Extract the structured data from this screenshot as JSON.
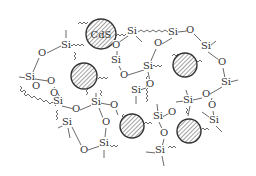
{
  "diagram": {
    "title": "",
    "colors": {
      "line": "#444444",
      "text": "#333333",
      "particle_fill": "#ffffff",
      "hatch": "#555555"
    },
    "nanoparticles": [
      {
        "id": "np1",
        "label": "CdS",
        "cx": 101,
        "cy": 34,
        "r": 15
      },
      {
        "id": "np2",
        "label": "",
        "cx": 84,
        "cy": 76,
        "r": 13
      },
      {
        "id": "np3",
        "label": "",
        "cx": 185,
        "cy": 65,
        "r": 12
      },
      {
        "id": "np4",
        "label": "",
        "cx": 132,
        "cy": 126,
        "r": 12
      },
      {
        "id": "np5",
        "label": "",
        "cx": 189,
        "cy": 131,
        "r": 12
      }
    ],
    "atoms": [
      {
        "t": "Si",
        "x": 66,
        "y": 47
      },
      {
        "t": "O",
        "x": 42,
        "y": 55
      },
      {
        "t": "Si",
        "x": 30,
        "y": 79
      },
      {
        "t": "O",
        "x": 51,
        "y": 83
      },
      {
        "t": "Si",
        "x": 58,
        "y": 103
      },
      {
        "t": "O",
        "x": 76,
        "y": 111
      },
      {
        "t": "Si",
        "x": 96,
        "y": 104
      },
      {
        "t": "O",
        "x": 114,
        "y": 107
      },
      {
        "t": "O",
        "x": 106,
        "y": 124
      },
      {
        "t": "Si",
        "x": 104,
        "y": 145
      },
      {
        "t": "O",
        "x": 84,
        "y": 152
      },
      {
        "t": "Si",
        "x": 67,
        "y": 124
      },
      {
        "t": "Si",
        "x": 116,
        "y": 62
      },
      {
        "t": "O",
        "x": 116,
        "y": 47
      },
      {
        "t": "Si",
        "x": 132,
        "y": 33
      },
      {
        "t": "O",
        "x": 124,
        "y": 77
      },
      {
        "t": "Si",
        "x": 148,
        "y": 68
      },
      {
        "t": "O",
        "x": 150,
        "y": 86
      },
      {
        "t": "Si",
        "x": 136,
        "y": 92
      },
      {
        "t": "Si",
        "x": 173,
        "y": 34
      },
      {
        "t": "O",
        "x": 190,
        "y": 32
      },
      {
        "t": "O",
        "x": 158,
        "y": 45
      },
      {
        "t": "Si",
        "x": 206,
        "y": 48
      },
      {
        "t": "O",
        "x": 222,
        "y": 64
      },
      {
        "t": "Si",
        "x": 226,
        "y": 84
      },
      {
        "t": "O",
        "x": 206,
        "y": 96
      },
      {
        "t": "Si",
        "x": 188,
        "y": 102
      },
      {
        "t": "O",
        "x": 212,
        "y": 107
      },
      {
        "t": "O",
        "x": 172,
        "y": 114
      },
      {
        "t": "Si",
        "x": 158,
        "y": 118
      },
      {
        "t": "O",
        "x": 164,
        "y": 135
      },
      {
        "t": "Si",
        "x": 160,
        "y": 152
      },
      {
        "t": "Si",
        "x": 214,
        "y": 122
      },
      {
        "t": "O",
        "x": 36,
        "y": 88
      },
      {
        "t": "O",
        "x": 54,
        "y": 95
      }
    ]
  }
}
